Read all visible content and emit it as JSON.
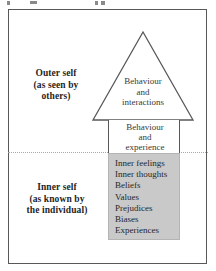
{
  "figure": {
    "title_fragment_visible": false,
    "background": "#ffffff",
    "frame_color": "#58585a",
    "divider_style": "dotted",
    "divider_color": "#a8a8aa"
  },
  "regions": {
    "outer": {
      "label_line1": "Outer self",
      "label_line2": "(as seen by",
      "label_line3": "others)"
    },
    "inner": {
      "label_line1": "Inner self",
      "label_line2": "(as known by",
      "label_line3": "the individual)"
    }
  },
  "triangle": {
    "text_line1": "Behaviour",
    "text_line2": "and",
    "text_line3": "interactions",
    "fill": "#ffffff",
    "stroke": "#58585a"
  },
  "shaft_white": {
    "text_line1": "Behaviour",
    "text_line2": "and",
    "text_line3": "experience",
    "fill": "#ffffff",
    "stroke": "#58585a"
  },
  "shaft_grey": {
    "fill": "#c9c9c9",
    "items": [
      "Inner feelings",
      "Inner thoughts",
      "Beliefs",
      "Values",
      "Prejudices",
      "Biases",
      "Experiences"
    ]
  }
}
